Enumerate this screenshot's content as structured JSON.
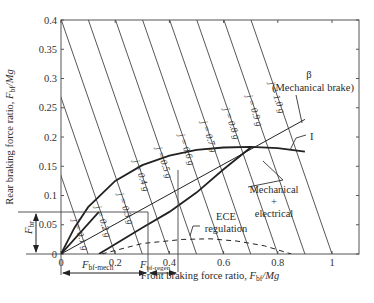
{
  "chart_data": {
    "type": "line",
    "title": "",
    "xlabel": "Front braking force ratio, F_bf/Mg",
    "ylabel": "Rear braking force ratio, F_br/Mg",
    "xlim": [
      0,
      1.1
    ],
    "ylim": [
      0,
      0.4
    ],
    "x_ticks": [
      "0",
      "0.2",
      "0.4",
      "0.6",
      "0.8",
      "1"
    ],
    "y_ticks": [
      "0",
      "0.05",
      "0.1",
      "0.15",
      "0.2",
      "0.25",
      "0.3",
      "0.35",
      "0.4"
    ],
    "grid": false,
    "iso_deceleration_lines": [
      {
        "label": "j = 0.1 g",
        "x_intercept": 0.1,
        "y_intercept": 0.1
      },
      {
        "label": "j = 0.2 g",
        "x_intercept": 0.2,
        "y_intercept": 0.2
      },
      {
        "label": "j = 0.3 g",
        "x_intercept": 0.3,
        "y_intercept": 0.3
      },
      {
        "label": "j = 0.4 g",
        "x_intercept": 0.4,
        "y_intercept": 0.4
      },
      {
        "label": "j = 0.5 g",
        "x_intercept": 0.5,
        "y_intercept": 0.5
      },
      {
        "label": "j = 0.6 g",
        "x_intercept": 0.6,
        "y_intercept": 0.6
      },
      {
        "label": "j = 0.7 g",
        "x_intercept": 0.7,
        "y_intercept": 0.7
      },
      {
        "label": "j = 0.8 g",
        "x_intercept": 0.8,
        "y_intercept": 0.8
      },
      {
        "label": "j = 0.9 g",
        "x_intercept": 0.9,
        "y_intercept": 0.9
      },
      {
        "label": "j = 1.0 g",
        "x_intercept": 1.0,
        "y_intercept": 1.0
      }
    ],
    "series": [
      {
        "name": "I (ideal distribution)",
        "style": "thick",
        "x": [
          0,
          0.05,
          0.1,
          0.2,
          0.3,
          0.4,
          0.5,
          0.6,
          0.7,
          0.8,
          0.9
        ],
        "y": [
          0,
          0.045,
          0.08,
          0.125,
          0.152,
          0.168,
          0.178,
          0.182,
          0.183,
          0.181,
          0.175
        ]
      },
      {
        "name": "β (Mechanical brake)",
        "style": "thin",
        "x": [
          0,
          0.9
        ],
        "y": [
          0,
          0.23
        ]
      },
      {
        "name": "Mechanical + electrical",
        "style": "thick",
        "x": [
          0.14,
          0.3,
          0.4,
          0.5,
          0.6,
          0.7
        ],
        "y": [
          0,
          0.045,
          0.072,
          0.105,
          0.145,
          0.182
        ]
      },
      {
        "name": "ECE regulation",
        "style": "dashed",
        "x": [
          0.15,
          0.3,
          0.45,
          0.55,
          0.65,
          0.75,
          0.85
        ],
        "y": [
          0,
          0.018,
          0.025,
          0.026,
          0.022,
          0.014,
          0
        ]
      },
      {
        "name": "Mechanical braking segment",
        "style": "thick",
        "x": [
          0,
          0.14
        ],
        "y": [
          0,
          0.072
        ]
      }
    ],
    "annotations": [
      {
        "text": "β",
        "x": 0.92,
        "y": 0.255
      },
      {
        "text": "(Mechanical brake)",
        "x": 0.92,
        "y": 0.235
      },
      {
        "text": "I",
        "x": 0.95,
        "y": 0.195
      },
      {
        "text": "Mechanical",
        "x": 0.78,
        "y": 0.115
      },
      {
        "text": "+",
        "x": 0.78,
        "y": 0.1
      },
      {
        "text": "electrical",
        "x": 0.78,
        "y": 0.085
      },
      {
        "text": "ECE",
        "x": 0.5,
        "y": 0.065
      },
      {
        "text": "regulation",
        "x": 0.5,
        "y": 0.05
      },
      {
        "text": "F_br",
        "x": -0.12,
        "y": 0.036
      },
      {
        "text": "F_bf-mech",
        "x": 0.14,
        "y": -0.03
      },
      {
        "text": "F_bf-regen",
        "x": 0.35,
        "y": -0.03
      }
    ],
    "reference_lines": {
      "F_br_level": 0.072,
      "F_bf_mech_end": 0.32,
      "F_bf_regen_end": 0.43
    }
  },
  "labels": {
    "xlabel_main": "Front braking force ratio, ",
    "xlabel_var": "F",
    "xlabel_sub": "bf",
    "xlabel_tail": "/Mg",
    "ylabel_main": "Rear braking force ratio, ",
    "ylabel_var": "F",
    "ylabel_sub": "bf",
    "ylabel_tail": "/Mg",
    "beta": "β",
    "beta_desc": "(Mechanical brake)",
    "ideal": "I",
    "mech1": "Mechanical",
    "mech2": "+",
    "mech3": "electrical",
    "ece1": "ECE",
    "ece2": "regulation",
    "fbr_var": "F",
    "fbr_sub": "br",
    "fbf_mech_var": "F",
    "fbf_mech_sub": "bf-mech",
    "fbf_regen_var": "F",
    "fbf_regen_sub": "bf-regen"
  }
}
